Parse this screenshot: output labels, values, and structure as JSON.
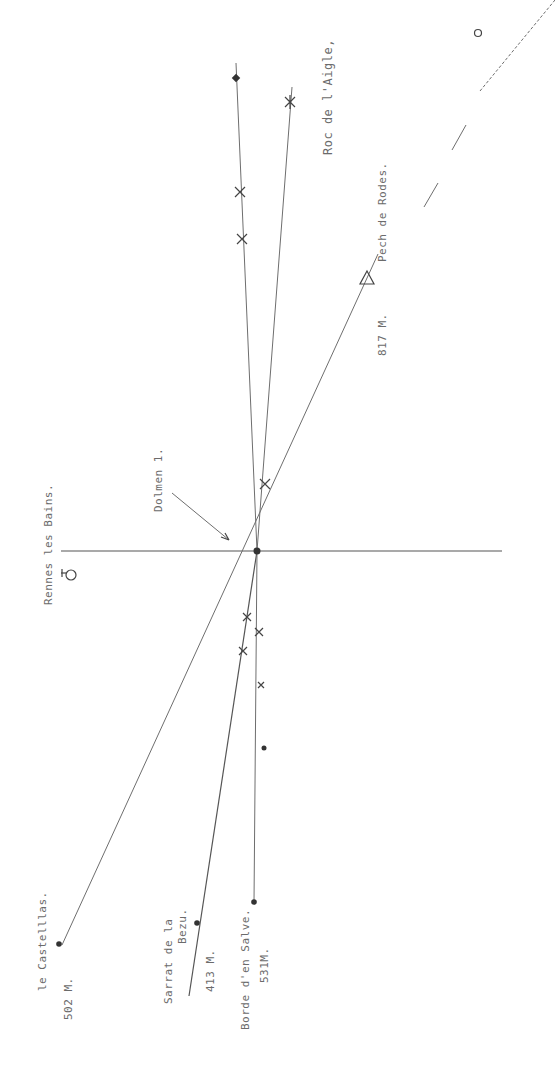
{
  "diagram": {
    "center": {
      "label": "Dolmen 1.",
      "x": 257,
      "y": 551
    },
    "labels": {
      "rennes": "Rennes les Bains.",
      "dolmen": "Dolmen 1.",
      "roc": "Roc de l'Aigle,",
      "pech_name": "Pech de Rodes.",
      "pech_alt": "817 M.",
      "castellas_name": "le Castelllas.",
      "castellas_alt": "502 M.",
      "sarrat_name_1": "Sarrat de la",
      "sarrat_name_2": "Bezu.",
      "sarrat_alt": "413 M.",
      "borde_name": "Borde d'en Salve.",
      "borde_alt": "531M."
    },
    "lines": [
      {
        "name": "horizontal-axis",
        "from": [
          61,
          551
        ],
        "to": [
          502,
          551
        ]
      },
      {
        "name": "north-line",
        "from": [
          257,
          551
        ],
        "to": [
          236,
          63
        ]
      },
      {
        "name": "roc-de-laigle-line",
        "from": [
          257,
          551
        ],
        "to": [
          292,
          87
        ]
      },
      {
        "name": "castellas-pech-line",
        "from": [
          62,
          945
        ],
        "to": [
          378,
          254
        ]
      },
      {
        "name": "sarrat-line",
        "from": [
          257,
          551
        ],
        "to": [
          189,
          996
        ]
      },
      {
        "name": "borde-line",
        "from": [
          257,
          551
        ],
        "to": [
          254,
          902
        ]
      }
    ],
    "markers": [
      {
        "type": "diamond",
        "x": 236,
        "y": 78
      },
      {
        "type": "x",
        "x": 240,
        "y": 192
      },
      {
        "type": "x",
        "x": 242,
        "y": 239
      },
      {
        "type": "star",
        "x": 290,
        "y": 102
      },
      {
        "type": "x",
        "x": 265,
        "y": 484
      },
      {
        "type": "triangle",
        "x": 367,
        "y": 278
      },
      {
        "type": "circle",
        "x": 478,
        "y": 33
      },
      {
        "type": "x",
        "x": 247,
        "y": 617
      },
      {
        "type": "x",
        "x": 243,
        "y": 651
      },
      {
        "type": "x",
        "x": 259,
        "y": 632
      },
      {
        "type": "x",
        "x": 261,
        "y": 685
      },
      {
        "type": "dot",
        "x": 264,
        "y": 748
      },
      {
        "type": "dot",
        "x": 59,
        "y": 944
      },
      {
        "type": "dot",
        "x": 197,
        "y": 923
      },
      {
        "type": "dot",
        "x": 254,
        "y": 902
      },
      {
        "type": "dot",
        "x": 257,
        "y": 551
      }
    ]
  }
}
